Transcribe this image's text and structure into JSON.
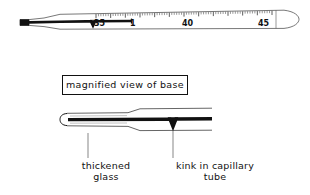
{
  "figure": {
    "title_box": {
      "label": "magnified view of base"
    },
    "thermometer": {
      "name": "clinical-thermometer",
      "scale_numbers": [
        {
          "value": "35",
          "x": 94,
          "y": 21
        },
        {
          "value": "1",
          "x": 129,
          "y": 21
        },
        {
          "value": "40",
          "x": 183,
          "y": 21
        },
        {
          "value": "45",
          "x": 259,
          "y": 21
        }
      ],
      "mercury_end_x": 132,
      "kink_x": 91
    },
    "callouts": [
      {
        "id": "thickened-glass",
        "label": "thickened\nglass",
        "leader_x": 88,
        "leader_top": 133,
        "leader_bottom": 158
      },
      {
        "id": "kink-in-capillary-tube",
        "label": "kink in capillary\ntube",
        "leader_x": 173,
        "leader_top": 130,
        "leader_bottom": 158
      }
    ]
  },
  "colors": {
    "ink": "#111111",
    "outline": "#555555",
    "paper": "#ffffff"
  }
}
